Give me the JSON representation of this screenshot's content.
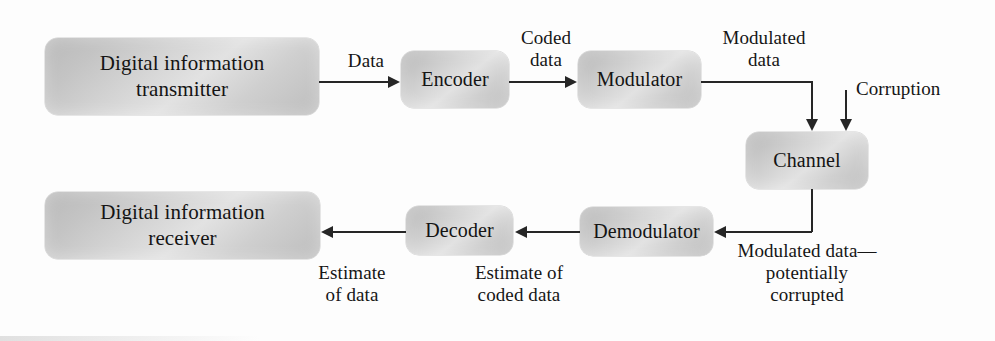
{
  "diagram": {
    "accent_color": "#262626",
    "block_fill_color": "#d2d2d2",
    "blocks": [
      {
        "id": "transmitter",
        "label": "Digital information\ntransmitter"
      },
      {
        "id": "encoder",
        "label": "Encoder"
      },
      {
        "id": "modulator",
        "label": "Modulator"
      },
      {
        "id": "channel",
        "label": "Channel"
      },
      {
        "id": "demodulator",
        "label": "Demodulator"
      },
      {
        "id": "decoder",
        "label": "Decoder"
      },
      {
        "id": "receiver",
        "label": "Digital information\nreceiver"
      }
    ],
    "edge_labels": {
      "data": "Data",
      "coded_data": "Coded\ndata",
      "modulated_data": "Modulated\ndata",
      "corruption": "Corruption",
      "modulated_corrupted": "Modulated data—\npotentially\ncorrupted",
      "estimate_of_coded_data": "Estimate of\ncoded data",
      "estimate_of_data": "Estimate\nof data"
    }
  }
}
